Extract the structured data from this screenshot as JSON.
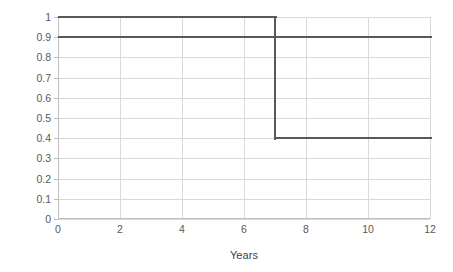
{
  "chart_data": {
    "type": "line",
    "title": "",
    "subtitle": "",
    "xlabel": "Years",
    "ylabel": "Quality of Life",
    "xlim": [
      0,
      12
    ],
    "ylim": [
      0,
      1
    ],
    "grid": true,
    "legend_position": "none",
    "x_ticks": [
      "0",
      "2",
      "4",
      "6",
      "8",
      "10",
      "12"
    ],
    "x_tick_values": [
      0,
      2,
      4,
      6,
      8,
      10,
      12
    ],
    "y_ticks": [
      "0",
      "0.1",
      "0.2",
      "0.3",
      "0.4",
      "0.5",
      "0.6",
      "0.7",
      "0.8",
      "0.9",
      "1"
    ],
    "y_tick_values": [
      0,
      0.1,
      0.2,
      0.3,
      0.4,
      0.5,
      0.6,
      0.7,
      0.8,
      0.9,
      1
    ],
    "line_color": "#595959",
    "grid_color": "#d9d9d9",
    "axis_color": "#bfbfbf",
    "series": [
      {
        "name": "Step curve",
        "step": "post",
        "x": [
          0,
          7,
          7,
          12
        ],
        "values": [
          1.0,
          1.0,
          0.4,
          0.4
        ],
        "color": "#595959"
      },
      {
        "name": "Constant curve",
        "step": "post",
        "x": [
          0,
          12
        ],
        "values": [
          0.9,
          0.9
        ],
        "color": "#595959"
      }
    ],
    "annotations": []
  },
  "axis": {
    "y_title": "Quality of Life",
    "x_title": "Years"
  }
}
